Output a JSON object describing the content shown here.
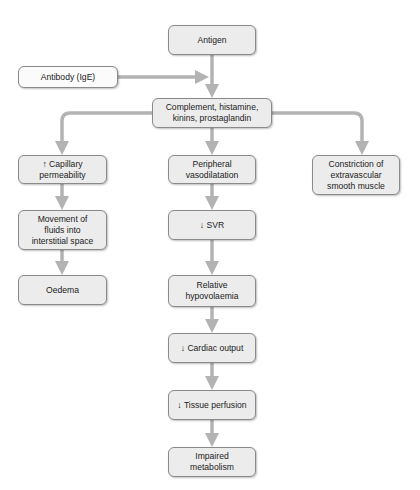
{
  "diagram": {
    "arrow_color": "#b3b3b3",
    "box_fill": "#ececec",
    "box_border": "#8a8a8a",
    "nodes": {
      "antigen": "Antigen",
      "antibody": "Antibody (IgE)",
      "mediators": "Complement, histamine,\nkinins, prostaglandin",
      "capillary": "↑ Capillary\npermeability",
      "peripheral": "Peripheral\nvasodilatation",
      "constriction": "Constriction of\nextravascular\nsmooth muscle",
      "movement": "Movement of\nfluids into\ninterstitial space",
      "svr": "↓ SVR",
      "oedema": "Oedema",
      "hypovolaemia": "Relative\nhypovolaemia",
      "cardiac": "↓ Cardiac output",
      "tissue": "↓ Tissue perfusion",
      "metabolism": "Impaired\nmetabolism"
    },
    "edges": [
      [
        "antigen",
        "mediators"
      ],
      [
        "antibody",
        "antigen-mediators-link"
      ],
      [
        "mediators",
        "capillary"
      ],
      [
        "mediators",
        "peripheral"
      ],
      [
        "mediators",
        "constriction"
      ],
      [
        "capillary",
        "movement"
      ],
      [
        "movement",
        "oedema"
      ],
      [
        "peripheral",
        "svr"
      ],
      [
        "svr",
        "hypovolaemia"
      ],
      [
        "hypovolaemia",
        "cardiac"
      ],
      [
        "cardiac",
        "tissue"
      ],
      [
        "tissue",
        "metabolism"
      ]
    ]
  }
}
